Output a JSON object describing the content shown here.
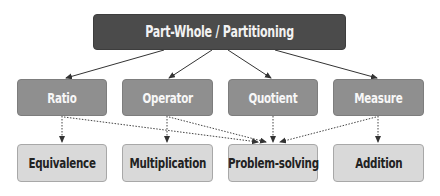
{
  "diagram": {
    "root": {
      "label": "Part-Whole / Partitioning"
    },
    "constructs": [
      {
        "label": "Ratio"
      },
      {
        "label": "Operator"
      },
      {
        "label": "Quotient"
      },
      {
        "label": "Measure"
      }
    ],
    "outcomes": [
      {
        "label": "Equivalence"
      },
      {
        "label": "Multiplication"
      },
      {
        "label": "Problem-solving"
      },
      {
        "label": "Addition"
      }
    ],
    "edges": {
      "solid": [
        {
          "from": "Part-Whole / Partitioning",
          "to": "Ratio"
        },
        {
          "from": "Part-Whole / Partitioning",
          "to": "Operator"
        },
        {
          "from": "Part-Whole / Partitioning",
          "to": "Quotient"
        },
        {
          "from": "Part-Whole / Partitioning",
          "to": "Measure"
        }
      ],
      "dotted": [
        {
          "from": "Ratio",
          "to": "Equivalence"
        },
        {
          "from": "Ratio",
          "to": "Problem-solving"
        },
        {
          "from": "Operator",
          "to": "Multiplication"
        },
        {
          "from": "Operator",
          "to": "Problem-solving"
        },
        {
          "from": "Quotient",
          "to": "Problem-solving"
        },
        {
          "from": "Measure",
          "to": "Problem-solving"
        },
        {
          "from": "Measure",
          "to": "Addition"
        }
      ]
    },
    "colors": {
      "root_fill": "#4b4b4b",
      "construct_fill": "#8f8f8f",
      "outcome_fill": "#d9d9d9",
      "edge": "#333333"
    }
  }
}
